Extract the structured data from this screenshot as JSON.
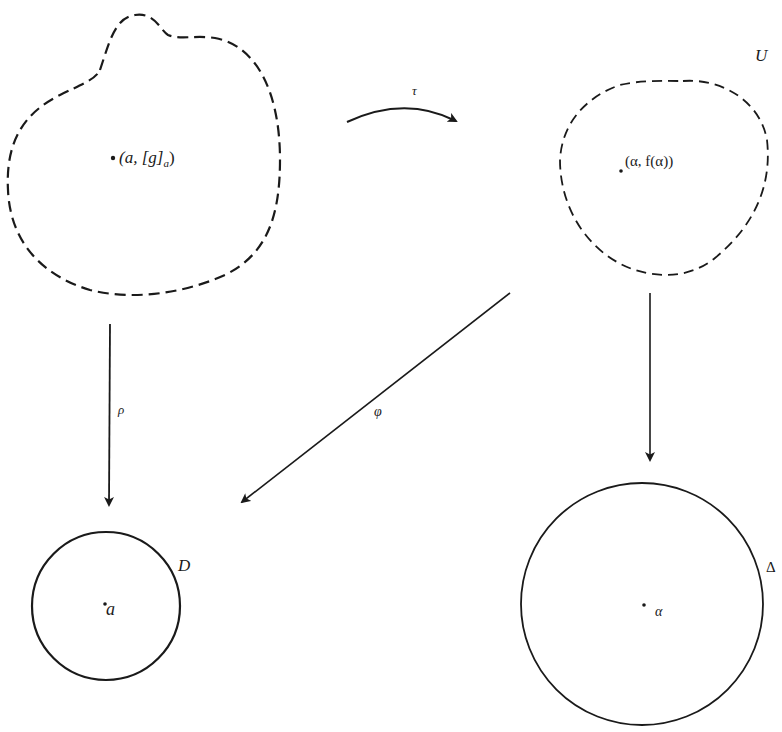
{
  "diagram": {
    "regions": {
      "germ_region": {
        "style": "dashed",
        "point_label": "(a, [g]",
        "point_subscript": "a",
        "point_label_close": ")"
      },
      "U_region": {
        "style": "dashed",
        "name": "U",
        "point_label": "(α, f(α))"
      },
      "D_disk": {
        "style": "solid",
        "name": "D",
        "point_label": "a"
      },
      "Delta_disk": {
        "style": "solid",
        "name": "Δ",
        "point_label": "α"
      }
    },
    "arrows": {
      "tau": {
        "label": "τ",
        "from": "germ_region",
        "to": "U_region"
      },
      "rho": {
        "label": "ρ",
        "from": "germ_region",
        "to": "D_disk"
      },
      "phi": {
        "label": "φ",
        "from": "U_region",
        "to": "D_disk"
      },
      "vertical_right": {
        "label": "",
        "from": "U_region",
        "to": "Delta_disk"
      }
    },
    "colors": {
      "stroke": "#1a1a1a",
      "background": "#ffffff"
    }
  }
}
